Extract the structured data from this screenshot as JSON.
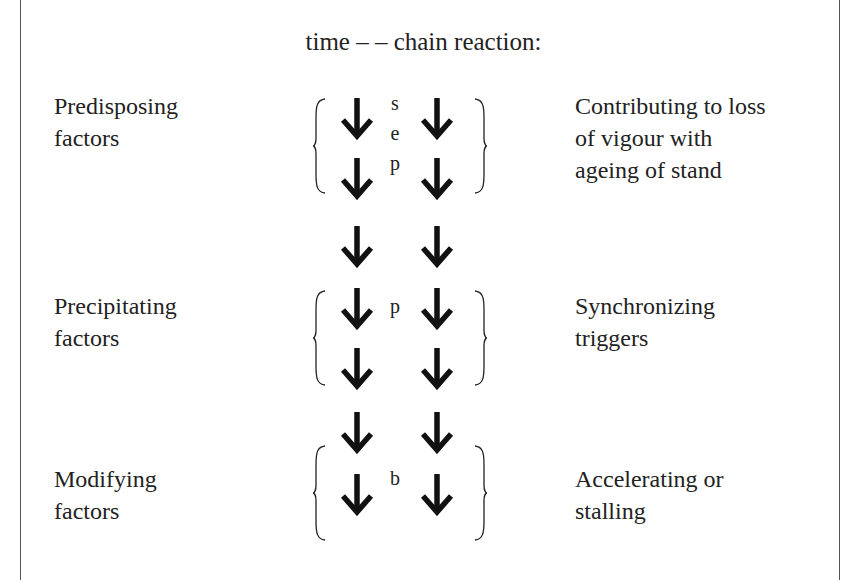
{
  "title": "time – – chain reaction:",
  "rows": [
    {
      "left": "Predisposing\nfactors",
      "right": "Contributing to loss\nof vigour with\nageing of stand",
      "letters": [
        "s",
        "e",
        "p"
      ]
    },
    {
      "left": "Precipitating\nfactors",
      "right": "Synchronizing\ntriggers",
      "letters": [
        "p"
      ]
    },
    {
      "left": "Modifying\nfactors",
      "right": "Accelerating or\nstalling",
      "letters": [
        "b"
      ]
    }
  ],
  "icons": {
    "arrow": "down-arrow-icon",
    "brace_left": "left-brace-icon",
    "brace_right": "right-brace-icon"
  }
}
